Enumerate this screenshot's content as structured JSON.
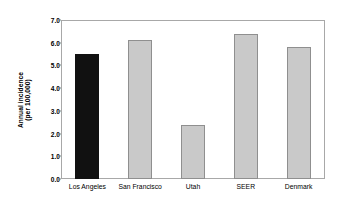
{
  "chart_data": {
    "type": "bar",
    "title": "",
    "xlabel": "",
    "ylabel_lines": [
      "Annual incidence",
      "(per 100,000)"
    ],
    "ylabel": "Annual incidence (per 100,000)",
    "categories": [
      "Los Angeles",
      "San Francisco",
      "Utah",
      "SEER",
      "Denmark"
    ],
    "values": [
      5.5,
      6.1,
      2.4,
      6.4,
      5.8
    ],
    "bar_colors": [
      "#111111",
      "#c9c9c9",
      "#c9c9c9",
      "#c9c9c9",
      "#c9c9c9"
    ],
    "ylim": [
      0.0,
      7.0
    ],
    "ytick_values": [
      0.0,
      1.0,
      2.0,
      3.0,
      4.0,
      5.0,
      6.0,
      7.0
    ],
    "ytick_labels": [
      "0.0",
      "1.0",
      "2.0",
      "3.0",
      "4.0",
      "5.0",
      "6.0",
      "7.0"
    ],
    "grid": false,
    "legend": false,
    "legend_position": "none",
    "frame_color": "#a8a8a8",
    "bar_border_color": "#8f8f8f",
    "background": "#ffffff"
  }
}
